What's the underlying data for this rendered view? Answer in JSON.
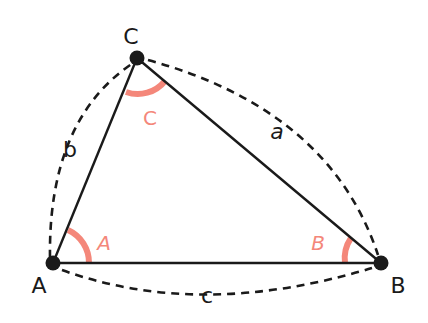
{
  "diagram": {
    "colors": {
      "line": "#1a1a1a",
      "vertex": "#1a1a1a",
      "angle_arc": "#f4877a",
      "angle_label": "#f4877a",
      "background": "#ffffff"
    },
    "vertices": [
      {
        "id": "A",
        "label": "A",
        "x": 53,
        "y": 263
      },
      {
        "id": "B",
        "label": "B",
        "x": 381,
        "y": 263
      },
      {
        "id": "C",
        "label": "C",
        "x": 137,
        "y": 58
      }
    ],
    "sides": [
      {
        "id": "a",
        "label": "a",
        "from": "B",
        "to": "C"
      },
      {
        "id": "b",
        "label": "b",
        "from": "A",
        "to": "C"
      },
      {
        "id": "c",
        "label": "c",
        "from": "A",
        "to": "B"
      }
    ],
    "angles": [
      {
        "id": "A",
        "label": "A",
        "vertex": "A"
      },
      {
        "id": "B",
        "label": "B",
        "vertex": "B"
      },
      {
        "id": "C",
        "label": "C",
        "vertex": "C"
      }
    ]
  }
}
